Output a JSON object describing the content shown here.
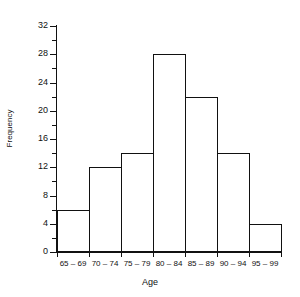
{
  "chart_data": {
    "type": "bar",
    "title": "Residential Care",
    "title_clipped": true,
    "categories": [
      "65 – 69",
      "70 – 74",
      "75 – 79",
      "80 – 84",
      "85 – 89",
      "90 – 94",
      "95 – 99"
    ],
    "values": [
      6,
      12,
      14,
      28,
      22,
      14,
      4
    ],
    "xlabel": "Age",
    "ylabel": "Frequency",
    "ylim": [
      0,
      32
    ],
    "y_major_ticks": [
      0,
      4,
      8,
      12,
      16,
      20,
      24,
      28,
      32
    ],
    "y_minor_ticks": [
      2,
      6,
      10,
      14,
      18,
      22,
      26,
      30
    ],
    "y_tick_labels": [
      "0",
      "4",
      "8",
      "12",
      "16",
      "20",
      "24",
      "28",
      "32"
    ],
    "grid": false,
    "legend": null,
    "bar_fill": "#ffffff",
    "bar_stroke": "#111111",
    "axis_color": "#111111",
    "background": "#ffffff"
  }
}
